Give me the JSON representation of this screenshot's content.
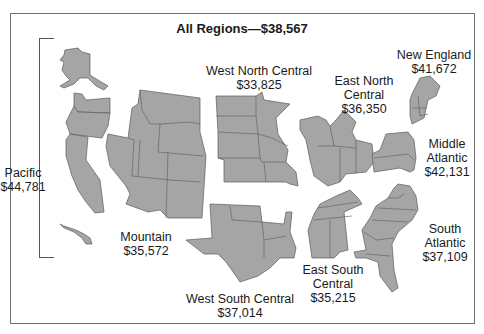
{
  "title": "All Regions—$38,567",
  "regions": [
    {
      "name": "Pacific",
      "value": "$44,781"
    },
    {
      "name": "Mountain",
      "value": "$35,572"
    },
    {
      "name": "West North Central",
      "value": "$33,825"
    },
    {
      "name": "East North Central",
      "value": "$36,350"
    },
    {
      "name": "New England",
      "value": "$41,672"
    },
    {
      "name": "Middle Atlantic",
      "value": "$42,131"
    },
    {
      "name": "South Atlantic",
      "value": "$37,109"
    },
    {
      "name": "East South Central",
      "value": "$35,215"
    },
    {
      "name": "West South Central",
      "value": "$37,014"
    }
  ],
  "labels": {
    "pacific": {
      "l1": "Pacific",
      "l2": "$44,781"
    },
    "mountain": {
      "l1": "Mountain",
      "l2": "$35,572"
    },
    "wnc": {
      "l1": "West North Central",
      "l2": "$33,825"
    },
    "enc": {
      "l1": "East North",
      "l2": "Central",
      "l3": "$36,350"
    },
    "ne": {
      "l1": "New England",
      "l2": "$41,672"
    },
    "ma": {
      "l1": "Middle",
      "l2": "Atlantic",
      "l3": "$42,131"
    },
    "sa": {
      "l1": "South",
      "l2": "Atlantic",
      "l3": "$37,109"
    },
    "esc": {
      "l1": "East South",
      "l2": "Central",
      "l3": "$35,215"
    },
    "wsc": {
      "l1": "West South Central",
      "l2": "$37,014"
    }
  },
  "colors": {
    "region_fill": "#a5a5a5",
    "border": "#5a5a5a",
    "text": "#1a1a1a"
  }
}
